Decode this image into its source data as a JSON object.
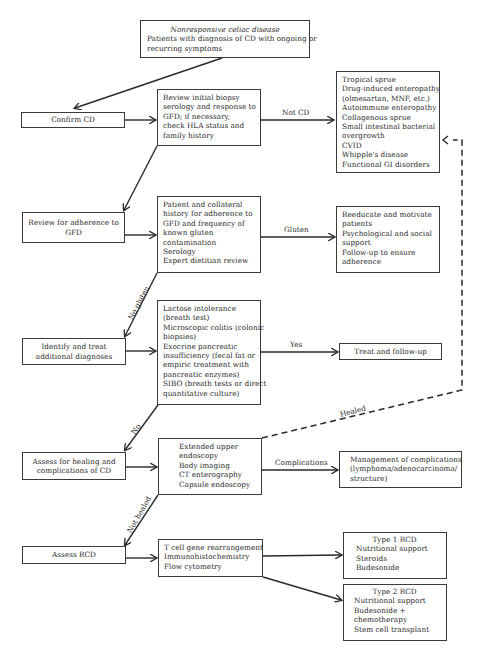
{
  "flowchart": {
    "start": {
      "title": "Nonresponsive celiac disease",
      "lines": [
        "Patients with diagnosis of CD with ongoing or",
        "recurring symptoms"
      ]
    },
    "steps": [
      {
        "label": "Confirm CD"
      },
      {
        "label": "Review for adherence to",
        "label2": "GFD"
      },
      {
        "label": "Identify and treat",
        "label2": "additional diagnoses"
      },
      {
        "label": "Assess for healing and",
        "label2": "complications of CD"
      },
      {
        "label": "Assess RCD"
      }
    ],
    "evaluations": [
      {
        "lines": [
          "Review initial biopsy",
          "serology and response to",
          "GFD; if necessary,",
          "check HLA status and",
          "family history"
        ]
      },
      {
        "lines": [
          "Patient and collateral",
          "history for adherence to",
          "GFD and frequency of",
          "known gluten",
          "contamination",
          "Serology",
          "Expert dietitian review"
        ]
      },
      {
        "lines": [
          "Lactose intolerance",
          "(breath test)",
          "Microscopic colitis (colonic",
          "biopsies)",
          "Exocrine pancreatic",
          "insufficiency (fecal fat or",
          "empiric treatment with",
          "pancreatic enzymes)",
          "SIBO (breath tests or direct",
          "quantitative culture)"
        ]
      },
      {
        "lines": [
          "Extended upper",
          "endoscopy",
          "Body imaging",
          "CT enterography",
          "Capsule endoscopy"
        ]
      },
      {
        "lines": [
          "T cell gene rearrangement",
          "Immunohistochemistry",
          "Flow cytometry"
        ]
      }
    ],
    "outcomes": [
      {
        "lines": [
          "Tropical sprue",
          "Drug-induced enteropathy",
          "(olmesartan, MNF, etc.)",
          "Autoimmune enteropathy",
          "Collagenous sprue",
          "Small intestinal bacterial",
          "overgrowth",
          "CVID",
          "Whipple's disease",
          "Functional GI disorders"
        ]
      },
      {
        "lines": [
          "Reeducate and motivate",
          "patients",
          "Psychological and social",
          "support",
          "Follow-up to ensure",
          "adherence"
        ]
      },
      {
        "lines": [
          "Treat and follow-up"
        ]
      },
      {
        "lines": [
          "Management of complications",
          "(lymphoma/adenocarcinoma/",
          "structure)"
        ]
      },
      {
        "title": "Type 1 RCD",
        "lines": [
          "Nutritional support",
          "Steroids",
          "Budesonide"
        ]
      },
      {
        "title": "Type 2 RCD",
        "lines": [
          "Nutritional support",
          "Budesonide +",
          "chemotherapy",
          "Stem cell transplant"
        ]
      }
    ],
    "edge_labels": {
      "not_cd": "Not  CD",
      "gluten": "Gluten",
      "no_gluten": "No gluten",
      "yes": "Yes",
      "no": "No",
      "healed": "Healed",
      "complications": "Complications",
      "not_healed": "Not healed"
    },
    "colors": {
      "line": "#2a2a2a",
      "border": "#3a3a3a",
      "background": "#ffffff"
    }
  }
}
